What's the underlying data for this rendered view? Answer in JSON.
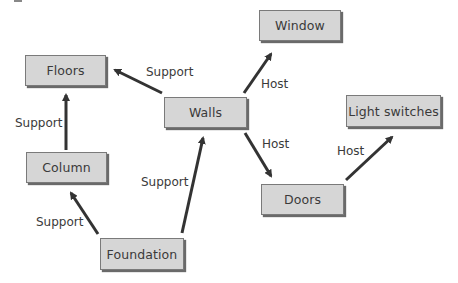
{
  "diagram": {
    "nodes": [
      {
        "id": "floors",
        "label": "Floors"
      },
      {
        "id": "window",
        "label": "Window"
      },
      {
        "id": "walls",
        "label": "Walls"
      },
      {
        "id": "light_switches",
        "label": "Light switches"
      },
      {
        "id": "column",
        "label": "Column"
      },
      {
        "id": "doors",
        "label": "Doors"
      },
      {
        "id": "foundation",
        "label": "Foundation"
      }
    ],
    "edges": [
      {
        "from": "walls",
        "to": "floors",
        "label": "Support"
      },
      {
        "from": "column",
        "to": "floors",
        "label": "Support"
      },
      {
        "from": "foundation",
        "to": "column",
        "label": "Support"
      },
      {
        "from": "foundation",
        "to": "walls",
        "label": "Support"
      },
      {
        "from": "walls",
        "to": "window",
        "label": "Host"
      },
      {
        "from": "walls",
        "to": "doors",
        "label": "Host"
      },
      {
        "from": "doors",
        "to": "light_switches",
        "label": "Host"
      }
    ],
    "colors": {
      "node_fill": "#d6d6d6",
      "node_border": "#7a7a7a",
      "arrow": "#333333",
      "text": "#3a3a3a"
    }
  }
}
